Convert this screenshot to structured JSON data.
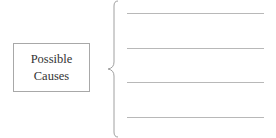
{
  "diagram": {
    "box": {
      "line1": "Possible",
      "line2": "Causes"
    },
    "brace_color": "#a0a0a0",
    "lines": [
      {
        "y": 13
      },
      {
        "y": 48
      },
      {
        "y": 82
      },
      {
        "y": 117
      }
    ],
    "line_color": "#b8b8b8"
  }
}
